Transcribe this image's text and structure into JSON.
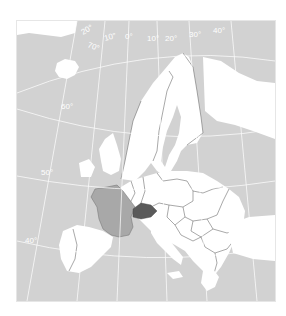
{
  "map": {
    "type": "political locator map",
    "region": "Europe",
    "highlighted_country": "Switzerland",
    "secondary_highlight": "France",
    "colors": {
      "sea": "#d2d2d2",
      "land_non_eu": "#d2d2d2",
      "land_eu": "#ffffff",
      "highlight_primary": "#5a5a5a",
      "highlight_secondary": "#a8a8a8",
      "graticule": "#ffffff",
      "borders": "#6e6e6e"
    },
    "graticule_labels": {
      "lon_w20": "20°",
      "lon_w10": "10°",
      "lon_0": "0°",
      "lon_e10": "10°",
      "lon_e20": "20°",
      "lon_e30": "30°",
      "lon_e40": "40°",
      "lat_70": "70°",
      "lat_60": "60°",
      "lat_50": "50°",
      "lat_40": "40°"
    }
  }
}
